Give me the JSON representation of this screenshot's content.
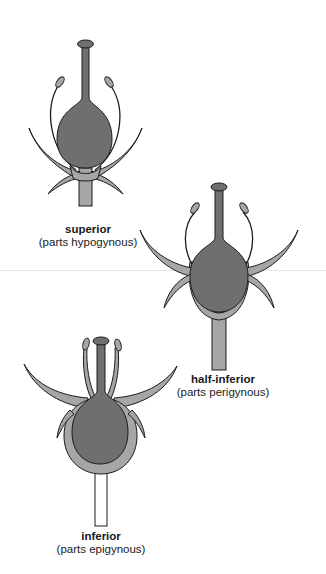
{
  "diagram": {
    "topic": "Ovary position",
    "colors": {
      "ovary": "#6f6f6f",
      "receptacle": "#a6a6a6",
      "outline": "#1c1c1c",
      "background": "#ffffff"
    },
    "flowers": [
      {
        "title": "superior",
        "subtitle": "(parts hypogynous)"
      },
      {
        "title": "half-inferior",
        "subtitle": "(parts perigynous)"
      },
      {
        "title": "inferior",
        "subtitle": "(parts epigynous)"
      }
    ]
  }
}
